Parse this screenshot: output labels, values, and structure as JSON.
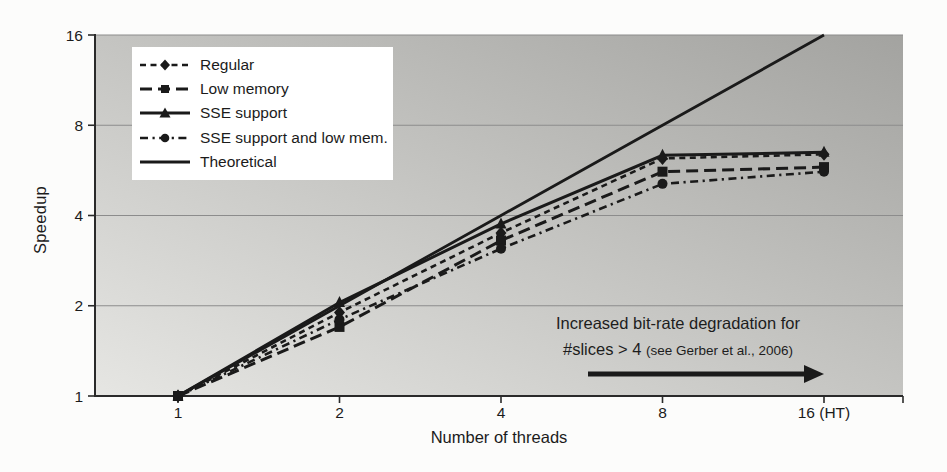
{
  "chart_data": {
    "type": "line",
    "title": "",
    "xlabel": "Number of threads",
    "ylabel": "Speedup",
    "x_scale": "log2",
    "y_scale": "log2",
    "xlim": [
      1,
      16
    ],
    "ylim": [
      1,
      16
    ],
    "grid": "horizontal",
    "legend_position": "top-left",
    "x": [
      1,
      2,
      4,
      8,
      16
    ],
    "x_tick_labels": [
      "1",
      "2",
      "4",
      "8",
      "16 (HT)"
    ],
    "y_ticks": [
      1,
      2,
      4,
      8,
      16
    ],
    "y_tick_labels": [
      "1",
      "2",
      "4",
      "8",
      "16"
    ],
    "series": [
      {
        "name": "Regular",
        "marker": "diamond",
        "line": "dashed",
        "values": [
          1,
          1.9,
          3.5,
          6.2,
          6.4
        ]
      },
      {
        "name": "Low memory",
        "marker": "square",
        "line": "long-dash",
        "values": [
          1,
          1.7,
          3.3,
          5.6,
          5.8
        ]
      },
      {
        "name": "SSE support",
        "marker": "triangle",
        "line": "solid",
        "values": [
          1,
          2.05,
          3.75,
          6.35,
          6.5
        ]
      },
      {
        "name": "SSE support and low mem.",
        "marker": "circle",
        "line": "dash-dot",
        "values": [
          1,
          1.8,
          3.1,
          5.1,
          5.6
        ]
      },
      {
        "name": "Theoretical",
        "marker": "none",
        "line": "solid-thick",
        "values": [
          1,
          2,
          4,
          8,
          16
        ]
      }
    ],
    "annotation": {
      "line1": "Increased bit-rate degradation for",
      "line2_main": "#slices > 4 ",
      "line2_note": "(see Gerber et al., 2006)",
      "arrow_direction": "right"
    },
    "colors": {
      "line": "#1a1a1a",
      "text": "#1b1b1b",
      "grid": "#8c8c8c",
      "axis": "#2a2a2a",
      "plot_bg_light": "#e6e6e3",
      "plot_bg_dark": "#a3a3a0",
      "legend_bg": "#ffffff"
    }
  }
}
